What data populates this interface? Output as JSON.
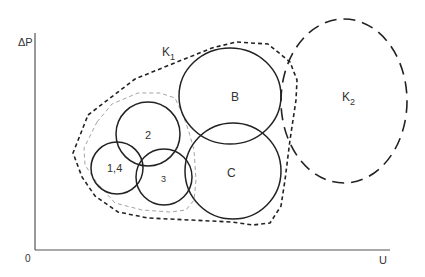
{
  "axes": {
    "y_label": "ΔP",
    "x_label": "U",
    "origin_label": "0"
  },
  "regions": {
    "k1": {
      "label": "K",
      "subscript": "1",
      "style": "dashed-bold"
    },
    "k2": {
      "label": "K",
      "subscript": "2",
      "style": "long-dashed"
    },
    "inner_boundary": {
      "style": "thin-gray-dashed"
    }
  },
  "circles": [
    {
      "id": "b",
      "label": "B"
    },
    {
      "id": "c",
      "label": "C"
    },
    {
      "id": "2",
      "label": "2"
    },
    {
      "id": "1-4",
      "label": "1,4"
    },
    {
      "id": "3",
      "label": "3"
    }
  ],
  "colors": {
    "line": "#222222",
    "axis": "#555555",
    "inner_dashed": "#999999"
  }
}
